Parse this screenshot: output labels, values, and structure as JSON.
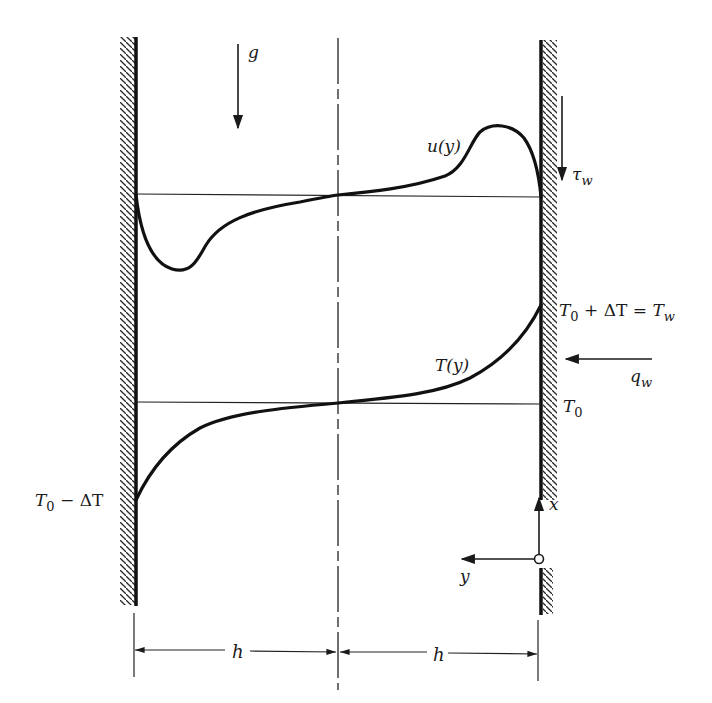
{
  "figure": {
    "colors": {
      "ink": "#1a1a1a",
      "background": "#ffffff"
    }
  },
  "labels": {
    "gravity": "g",
    "velocity_profile": "u(y)",
    "wall_shear_base": "τ",
    "wall_shear_sub": "w",
    "hot_wall_temp": {
      "T0_base": "T",
      "T0_sub": "0",
      "plus": " + ",
      "delta": "ΔT",
      "equals": " = ",
      "Tw_base": "T",
      "Tw_sub": "w"
    },
    "temperature_profile": "T(y)",
    "heat_flux_base": "q",
    "heat_flux_sub": "w",
    "reference_temp": {
      "base": "T",
      "sub": "0"
    },
    "cold_wall_temp": {
      "T0_base": "T",
      "T0_sub": "0",
      "minus": " − ",
      "delta": "ΔT"
    },
    "axis_x": "x",
    "axis_y": "y",
    "half_width_left": "h",
    "half_width_right": "h"
  },
  "geometry": {
    "left_wall_x": 136,
    "right_wall_x": 541,
    "centerline_x": 338,
    "velocity_baseline_y": 195,
    "temperature_baseline_y": 403,
    "dimension_line_y": 651
  }
}
